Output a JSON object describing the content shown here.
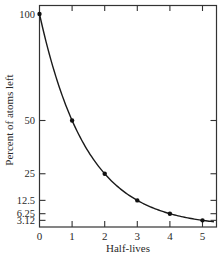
{
  "chart_data": {
    "type": "line",
    "title": "",
    "xlabel": "Half-lives",
    "ylabel": "Percent of atoms left",
    "x": [
      0,
      1,
      2,
      3,
      4,
      5
    ],
    "series": [
      {
        "name": "Percent of atoms left",
        "values": [
          100,
          50,
          25,
          12.5,
          6.25,
          3.12
        ]
      }
    ],
    "x_ticks": [
      "0",
      "1",
      "2",
      "3",
      "4",
      "5"
    ],
    "y_ticks": [
      "100",
      "50",
      "25",
      "12.5",
      "6.25",
      "3.12"
    ],
    "xlim": [
      0,
      5.4
    ],
    "ylim": [
      0,
      100
    ],
    "grid": false,
    "legend": "none",
    "markers": true,
    "colors": {
      "line": "#1a1a1a",
      "axis": "#333333",
      "background": "#ffffff"
    }
  }
}
